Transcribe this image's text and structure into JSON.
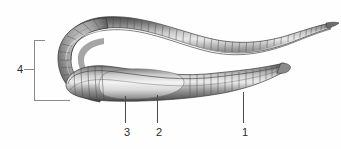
{
  "figure": {
    "style": "grayscale pencil/airbrush scientific illustration",
    "background_color": "#fefefe",
    "body_colors": {
      "outline": "#3a3a3a",
      "dark_shade": "#4e4e4e",
      "mid_shade": "#8d8d8d",
      "light_shade": "#d8d8d8",
      "highlight": "#f2f2f2",
      "clitellum_light": "#ededed"
    },
    "label_color": "#2b2b2b",
    "leader_color": "#4a4a4a",
    "bracket_color": "#8a8a8a"
  },
  "callouts": [
    {
      "id": "callout-1",
      "label": "1",
      "label_x": 238,
      "label_y": 126,
      "leader_x": 243,
      "leader_top": 92,
      "leader_bottom": 123
    },
    {
      "id": "callout-2",
      "label": "2",
      "label_x": 152,
      "label_y": 126,
      "leader_x": 157,
      "leader_top": 95,
      "leader_bottom": 123
    },
    {
      "id": "callout-3",
      "label": "3",
      "label_x": 120,
      "label_y": 126,
      "leader_x": 125,
      "leader_top": 96,
      "leader_bottom": 123
    }
  ],
  "bracket": {
    "id": "callout-4",
    "label": "4",
    "label_x": 13,
    "label_y": 63,
    "tick_x": 24,
    "tick_y": 69,
    "tick_width": 11,
    "vertical_x": 34,
    "vertical_top": 40,
    "vertical_height": 61,
    "top_arm_y": 40,
    "top_arm_x": 34,
    "top_arm_width": 11,
    "bottom_arm_y": 100,
    "bottom_arm_x": 34,
    "bottom_arm_width": 36
  }
}
